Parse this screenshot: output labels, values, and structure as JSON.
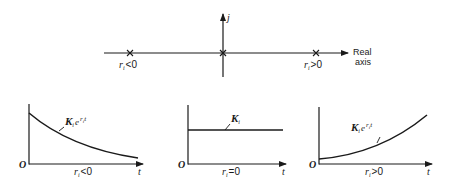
{
  "s_plane": {
    "vertical_axis_label": "j",
    "horizontal_axis_label_line1": "Real",
    "horizontal_axis_label_line2": "axis",
    "poles": [
      {
        "position": "left",
        "label_var": "r",
        "label_sub": "i",
        "label_rel": "<0"
      },
      {
        "position": "origin"
      },
      {
        "position": "right",
        "label_var": "r",
        "label_sub": "i",
        "label_rel": ">0"
      }
    ]
  },
  "plots": [
    {
      "name": "decaying",
      "origin_label": "O",
      "t_label": "t",
      "curve_label_K": "K",
      "curve_label_sub": "i",
      "curve_label_e": "e",
      "curve_label_exp": "r",
      "curve_label_exp_sub": "i",
      "curve_label_exp_t": "t",
      "caption_var": "r",
      "caption_sub": "i",
      "caption_rel": "<0"
    },
    {
      "name": "constant",
      "origin_label": "O",
      "t_label": "t",
      "curve_label_K": "K",
      "curve_label_sub": "i",
      "caption_var": "r",
      "caption_sub": "i",
      "caption_rel": "=0"
    },
    {
      "name": "growing",
      "origin_label": "O",
      "t_label": "t",
      "curve_label_K": "K",
      "curve_label_sub": "i",
      "curve_label_e": "e",
      "curve_label_exp": "r",
      "curve_label_exp_sub": "i",
      "curve_label_exp_t": "t",
      "caption_var": "r",
      "caption_sub": "i",
      "caption_rel": ">0"
    }
  ],
  "colors": {
    "ink": "#1a1a1a",
    "background": "#ffffff"
  }
}
